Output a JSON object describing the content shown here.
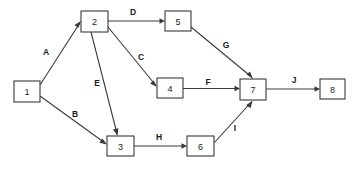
{
  "diagram": {
    "type": "directed-graph",
    "background_color": "#ffffff",
    "stroke_color": "#3a3a3a",
    "text_color": "#1a1a1a",
    "nodes": [
      {
        "id": "1",
        "label": "1",
        "x": 14,
        "y": 81,
        "w": 26,
        "h": 21
      },
      {
        "id": "2",
        "label": "2",
        "x": 81,
        "y": 11,
        "w": 27,
        "h": 21
      },
      {
        "id": "3",
        "label": "3",
        "x": 107,
        "y": 136,
        "w": 27,
        "h": 20
      },
      {
        "id": "4",
        "label": "4",
        "x": 157,
        "y": 78,
        "w": 26,
        "h": 20
      },
      {
        "id": "5",
        "label": "5",
        "x": 165,
        "y": 11,
        "w": 26,
        "h": 20
      },
      {
        "id": "6",
        "label": "6",
        "x": 187,
        "y": 136,
        "w": 27,
        "h": 20
      },
      {
        "id": "7",
        "label": "7",
        "x": 240,
        "y": 79,
        "w": 26,
        "h": 21
      },
      {
        "id": "8",
        "label": "8",
        "x": 320,
        "y": 79,
        "w": 25,
        "h": 20
      }
    ],
    "edges": [
      {
        "id": "A",
        "label": "A",
        "from": "1",
        "to": "2",
        "label_x": 46,
        "label_y": 52
      },
      {
        "id": "B",
        "label": "B",
        "from": "1",
        "to": "3",
        "label_x": 75,
        "label_y": 114
      },
      {
        "id": "C",
        "label": "C",
        "from": "2",
        "to": "4",
        "label_x": 141,
        "label_y": 57
      },
      {
        "id": "D",
        "label": "D",
        "from": "2",
        "to": "5",
        "label_x": 133,
        "label_y": 12
      },
      {
        "id": "E",
        "label": "E",
        "from": "2",
        "to": "3",
        "label_x": 97,
        "label_y": 83
      },
      {
        "id": "F",
        "label": "F",
        "from": "4",
        "to": "7",
        "label_x": 208,
        "label_y": 82
      },
      {
        "id": "G",
        "label": "G",
        "from": "5",
        "to": "7",
        "label_x": 226,
        "label_y": 45
      },
      {
        "id": "H",
        "label": "H",
        "from": "3",
        "to": "6",
        "label_x": 159,
        "label_y": 137
      },
      {
        "id": "I",
        "label": "I",
        "from": "6",
        "to": "7",
        "label_x": 235,
        "label_y": 128
      },
      {
        "id": "J",
        "label": "J",
        "from": "7",
        "to": "8",
        "label_x": 294,
        "label_y": 80
      }
    ]
  }
}
